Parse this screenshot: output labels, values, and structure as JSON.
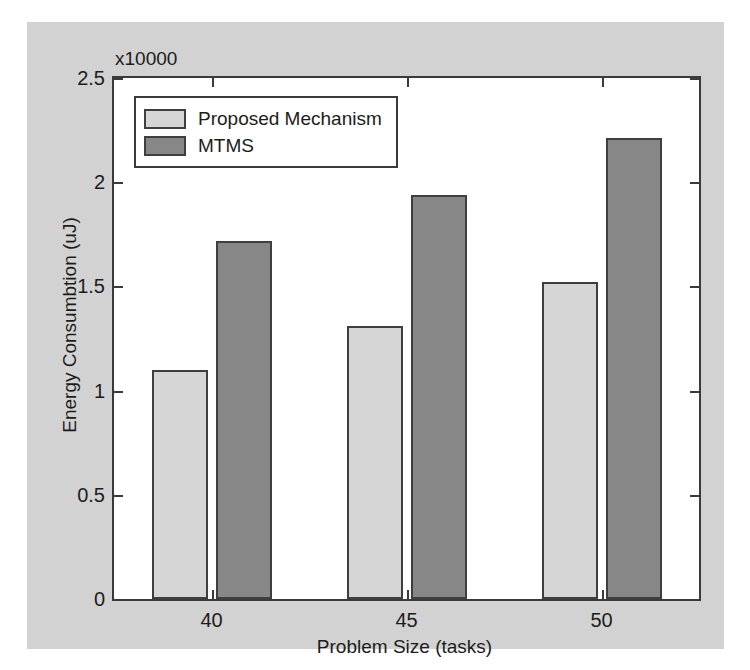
{
  "chart_data": {
    "type": "bar",
    "title": "",
    "subtitle": "",
    "xlabel": "Problem Size (tasks)",
    "ylabel": "Energy Consumbtion (uJ)",
    "exponent_label": "x10000",
    "categories": [
      "40",
      "45",
      "50"
    ],
    "series": [
      {
        "name": "Proposed Mechanism",
        "color": "#d6d6d6",
        "values": [
          1.1,
          1.31,
          1.52
        ]
      },
      {
        "name": "MTMS",
        "color": "#878787",
        "values": [
          1.72,
          1.94,
          2.21
        ]
      }
    ],
    "ylim": [
      0,
      2.5
    ],
    "yticks": [
      0,
      0.5,
      1,
      1.5,
      2,
      2.5
    ],
    "ytick_labels": [
      "0",
      "0.5",
      "1",
      "1.5",
      "2",
      "2.5"
    ],
    "xtick_labels": [
      "40",
      "45",
      "50"
    ],
    "grid": false,
    "legend_position": "top-left",
    "background_color": "#d2d2d2",
    "plot_background_color": "#ffffff",
    "axis_color": "#3a3a3a"
  }
}
